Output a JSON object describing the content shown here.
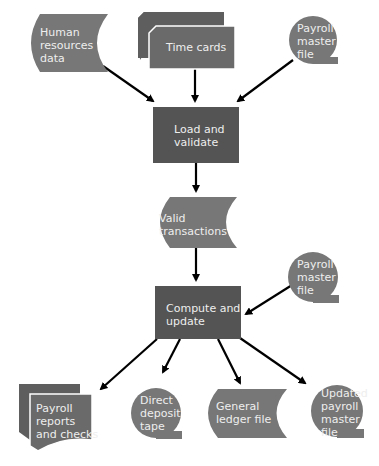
{
  "diagram": {
    "type": "system flowchart",
    "colors": {
      "process": "#545454",
      "data": "#777777",
      "card": "#6a6a6a",
      "text": "#eeeeee",
      "arrow": "#000000",
      "background": "#ffffff"
    },
    "nodes": {
      "hr_data": {
        "shape": "stored-data",
        "lines": [
          "Human",
          "resources",
          "data"
        ]
      },
      "time_cards": {
        "shape": "card-stack",
        "lines": [
          "Time cards"
        ]
      },
      "payroll_master_in": {
        "shape": "magnetic-tape",
        "lines": [
          "Payroll",
          "master",
          "file"
        ]
      },
      "load_validate": {
        "shape": "process",
        "lines": [
          "Load and",
          "validate"
        ]
      },
      "valid_transactions": {
        "shape": "stored-data",
        "lines": [
          "Valid",
          "transactions"
        ]
      },
      "payroll_master_in2": {
        "shape": "magnetic-tape",
        "lines": [
          "Payroll",
          "master",
          "file"
        ]
      },
      "compute_update": {
        "shape": "process",
        "lines": [
          "Compute and",
          "update"
        ]
      },
      "reports_checks": {
        "shape": "multi-document",
        "lines": [
          "Payroll",
          "reports",
          "and checks"
        ]
      },
      "direct_deposit": {
        "shape": "magnetic-tape",
        "lines": [
          "Direct",
          "deposit",
          "tape"
        ]
      },
      "general_ledger": {
        "shape": "stored-data",
        "lines": [
          "General",
          "ledger file"
        ]
      },
      "updated_master": {
        "shape": "magnetic-tape",
        "lines": [
          "Updated",
          "payroll",
          "master",
          "file"
        ]
      }
    },
    "edges": [
      {
        "from": "hr_data",
        "to": "load_validate"
      },
      {
        "from": "time_cards",
        "to": "load_validate"
      },
      {
        "from": "payroll_master_in",
        "to": "load_validate"
      },
      {
        "from": "load_validate",
        "to": "valid_transactions"
      },
      {
        "from": "valid_transactions",
        "to": "compute_update"
      },
      {
        "from": "payroll_master_in2",
        "to": "compute_update"
      },
      {
        "from": "compute_update",
        "to": "reports_checks"
      },
      {
        "from": "compute_update",
        "to": "direct_deposit"
      },
      {
        "from": "compute_update",
        "to": "general_ledger"
      },
      {
        "from": "compute_update",
        "to": "updated_master"
      }
    ]
  }
}
